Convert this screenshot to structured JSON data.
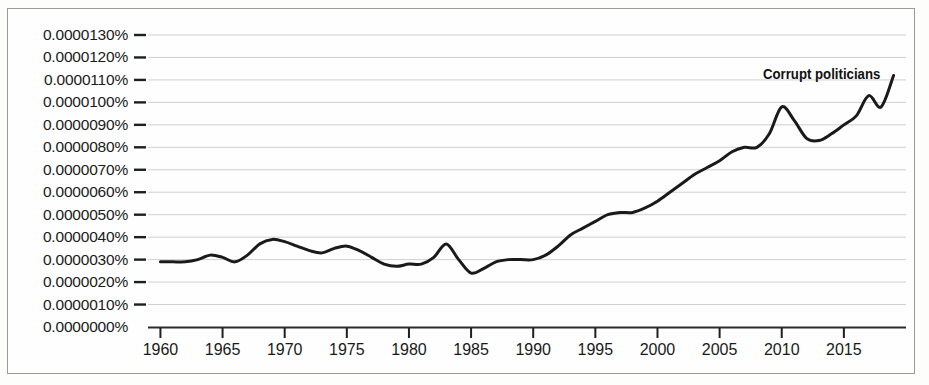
{
  "chart_data": {
    "type": "line",
    "title": "",
    "subtitle": "",
    "xlabel": "",
    "ylabel": "",
    "annotation": "Corrupt politicians",
    "grid": true,
    "legend_position": "inline-end-of-line",
    "xlim": [
      1959,
      2020
    ],
    "ylim": [
      0.0,
      1.35e-05
    ],
    "x_ticks": [
      1960,
      1965,
      1970,
      1975,
      1980,
      1985,
      1990,
      1995,
      2000,
      2005,
      2010,
      2015
    ],
    "x_tick_labels": [
      "1960",
      "1965",
      "1970",
      "1975",
      "1980",
      "1985",
      "1990",
      "1995",
      "2000",
      "2005",
      "2010",
      "2015"
    ],
    "y_ticks": [
      0.0,
      1e-06,
      2e-06,
      3e-06,
      4e-06,
      5e-06,
      6e-06,
      7e-06,
      8e-06,
      9e-06,
      1e-05,
      1.1e-05,
      1.2e-05,
      1.3e-05
    ],
    "y_tick_labels": [
      "0.0000130%",
      "0.0000120%",
      "0.0000110%",
      "0.0000100%",
      "0.0000090%",
      "0.0000080%",
      "0.0000070%",
      "0.0000060%",
      "0.0000050%",
      "0.0000040%",
      "0.0000030%",
      "0.0000020%",
      "0.0000010%",
      "0.0000000%"
    ],
    "line_color": "#1a1a1a",
    "line_width": 3.0,
    "series": [
      {
        "name": "Corrupt politicians",
        "x": [
          1960,
          1961,
          1962,
          1963,
          1964,
          1965,
          1966,
          1967,
          1968,
          1969,
          1970,
          1971,
          1972,
          1973,
          1974,
          1975,
          1976,
          1977,
          1978,
          1979,
          1980,
          1981,
          1982,
          1983,
          1984,
          1985,
          1986,
          1987,
          1988,
          1989,
          1990,
          1991,
          1992,
          1993,
          1994,
          1995,
          1996,
          1997,
          1998,
          1999,
          2000,
          2001,
          2002,
          2003,
          2004,
          2005,
          2006,
          2007,
          2008,
          2009,
          2010,
          2011,
          2012,
          2013,
          2014,
          2015,
          2016,
          2017,
          2018,
          2019
        ],
        "values": [
          2.9e-06,
          2.9e-06,
          2.9e-06,
          3e-06,
          3.2e-06,
          3.1e-06,
          2.9e-06,
          3.2e-06,
          3.7e-06,
          3.9e-06,
          3.8e-06,
          3.6e-06,
          3.4e-06,
          3.3e-06,
          3.5e-06,
          3.6e-06,
          3.4e-06,
          3.1e-06,
          2.8e-06,
          2.7e-06,
          2.8e-06,
          2.8e-06,
          3.1e-06,
          3.7e-06,
          3e-06,
          2.4e-06,
          2.6e-06,
          2.9e-06,
          3e-06,
          3e-06,
          3e-06,
          3.2e-06,
          3.6e-06,
          4.1e-06,
          4.4e-06,
          4.7e-06,
          5e-06,
          5.1e-06,
          5.1e-06,
          5.3e-06,
          5.6e-06,
          6e-06,
          6.4e-06,
          6.8e-06,
          7.1e-06,
          7.4e-06,
          7.8e-06,
          8e-06,
          8e-06,
          8.6e-06,
          9.8e-06,
          9.2e-06,
          8.4e-06,
          8.3e-06,
          8.6e-06,
          9e-06,
          9.4e-06,
          1.03e-05,
          9.8e-06,
          1.12e-05
        ]
      }
    ]
  }
}
